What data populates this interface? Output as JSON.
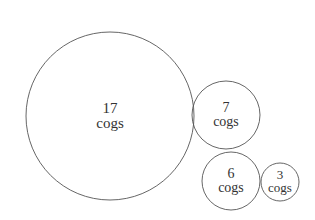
{
  "diagram": {
    "stroke_color": "#555555",
    "text_color": "#333333",
    "background": "#ffffff",
    "circles": [
      {
        "value": "17",
        "unit": "cogs",
        "cx": 110,
        "cy": 116,
        "r": 84,
        "font": 15
      },
      {
        "value": "7",
        "unit": "cogs",
        "cx": 226,
        "cy": 115,
        "r": 34,
        "font": 14
      },
      {
        "value": "6",
        "unit": "cogs",
        "cx": 231,
        "cy": 181,
        "r": 29,
        "font": 14
      },
      {
        "value": "3",
        "unit": "cogs",
        "cx": 280,
        "cy": 182,
        "r": 19,
        "font": 13
      }
    ]
  }
}
